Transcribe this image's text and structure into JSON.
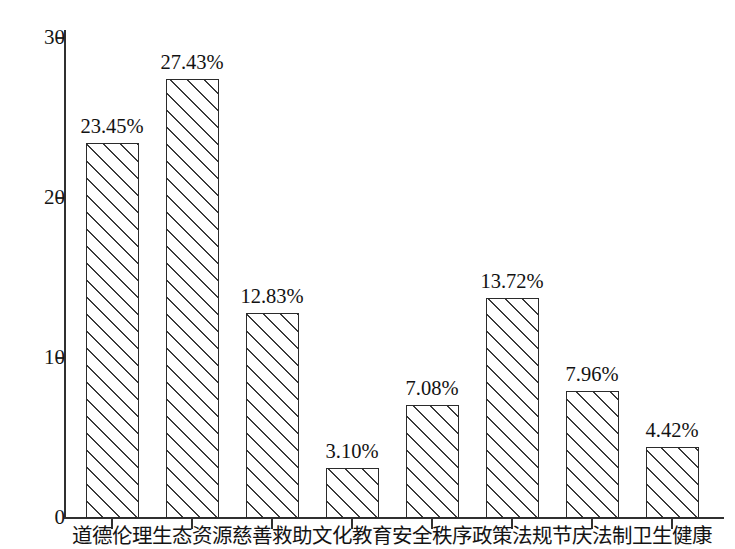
{
  "chart_data": {
    "type": "bar",
    "title": "",
    "subtitle": "",
    "xlabel": "",
    "ylabel": "",
    "ylim": [
      0,
      30
    ],
    "yticks": [
      0,
      10,
      20,
      30
    ],
    "ytick_labels": [
      "0",
      "10",
      "20",
      "30"
    ],
    "grid": false,
    "legend": "none",
    "categories": [
      "道德伦理",
      "生态资源",
      "慈善救助",
      "文化教育",
      "安全秩序",
      "政策法规",
      "节庆法制",
      "卫生健康"
    ],
    "values": [
      23.45,
      27.43,
      12.83,
      3.1,
      7.08,
      13.72,
      7.96,
      4.42
    ],
    "data_labels": [
      "23.45%",
      "27.43%",
      "12.83%",
      "3.10%",
      "7.08%",
      "13.72%",
      "7.96%",
      "4.42%"
    ],
    "bar_style": {
      "fill": "#ffffff",
      "hatch": "forward-diagonal",
      "edge_color": "#2b2b2b"
    },
    "axis_color": "#303030"
  }
}
